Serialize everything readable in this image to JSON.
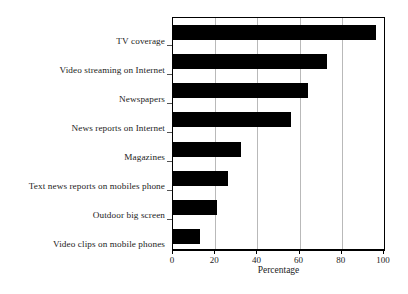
{
  "chart_data": {
    "type": "bar",
    "orientation": "horizontal",
    "title": "",
    "xlabel": "Percentage",
    "ylabel": "",
    "xlim": [
      0,
      100
    ],
    "xticks": [
      0,
      20,
      40,
      60,
      80,
      100
    ],
    "grid": "vertical",
    "legend": "none",
    "bar_color": "#000000",
    "categories": [
      "TV coverage",
      "Video streaming on Internet",
      "Newspapers",
      "News reports on Internet",
      "Magazines",
      "Text news reports on mobiles phone",
      "Outdoor big screen",
      "Video clips on mobile phones"
    ],
    "values": [
      96,
      73,
      64,
      56,
      32,
      26,
      21,
      13
    ]
  },
  "axis": {
    "tick_labels": [
      "0",
      "20",
      "40",
      "60",
      "80",
      "100"
    ],
    "x_title": "Percentage"
  }
}
